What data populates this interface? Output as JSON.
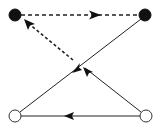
{
  "diagram": {
    "type": "directed-graph",
    "colors": {
      "stroke": "#222222",
      "filled_node": "#111111",
      "hollow_node": "#ffffff"
    },
    "nodes": [
      {
        "id": "top-left",
        "style": "filled"
      },
      {
        "id": "top-right",
        "style": "filled"
      },
      {
        "id": "bottom-left",
        "style": "hollow"
      },
      {
        "id": "bottom-right",
        "style": "hollow"
      }
    ],
    "edges": [
      {
        "id": "e1",
        "from": "top-left",
        "to": "top-right",
        "style": "dashed",
        "direction": "forward"
      },
      {
        "id": "e2",
        "from": "top-right",
        "to": "bottom-left",
        "style": "solid",
        "direction": "forward"
      },
      {
        "id": "e3",
        "from": "bottom-right",
        "to": "bottom-left",
        "style": "solid",
        "direction": "forward"
      },
      {
        "id": "e4",
        "from": "bottom-right",
        "to": "crossing",
        "style": "solid",
        "direction": "forward"
      },
      {
        "id": "e5",
        "from": "crossing",
        "to": "top-left",
        "style": "dashed",
        "direction": "forward"
      }
    ]
  }
}
